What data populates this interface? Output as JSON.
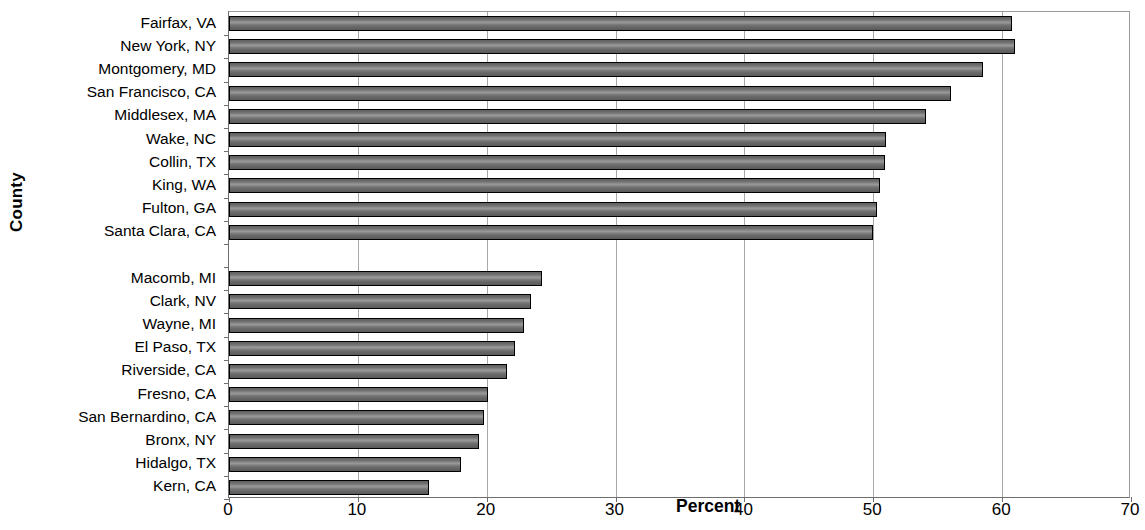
{
  "chart_data": {
    "type": "bar",
    "orientation": "horizontal",
    "title": "",
    "xlabel": "Percent",
    "ylabel": "County",
    "xlim": [
      0,
      70
    ],
    "ylim": null,
    "xticks": [
      0,
      10,
      20,
      30,
      40,
      50,
      60,
      70
    ],
    "grid": "vertical",
    "legend": null,
    "categories": [
      "Fairfax, VA",
      "New York, NY",
      "Montgomery, MD",
      "San Francisco, CA",
      "Middlesex, MA",
      "Wake, NC",
      "Collin, TX",
      "King, WA",
      "Fulton, GA",
      "Santa Clara, CA",
      "",
      "Macomb, MI",
      "Clark, NV",
      "Wayne, MI",
      "El Paso, TX",
      "Riverside, CA",
      "Fresno, CA",
      "San Bernardino, CA",
      "Bronx, NY",
      "Hidalgo, TX",
      "Kern, CA"
    ],
    "values": [
      60.8,
      61.0,
      58.5,
      56.0,
      54.1,
      51.0,
      50.9,
      50.5,
      50.3,
      50.0,
      null,
      24.3,
      23.4,
      22.9,
      22.2,
      21.6,
      20.1,
      19.8,
      19.4,
      18.0,
      15.5
    ],
    "bar_color": "#6e6e6e",
    "bar_border_color": "#000000",
    "gridline_color": "#a8a8a8",
    "axis_color": "#6e6e6e",
    "background_color": "#ffffff"
  }
}
